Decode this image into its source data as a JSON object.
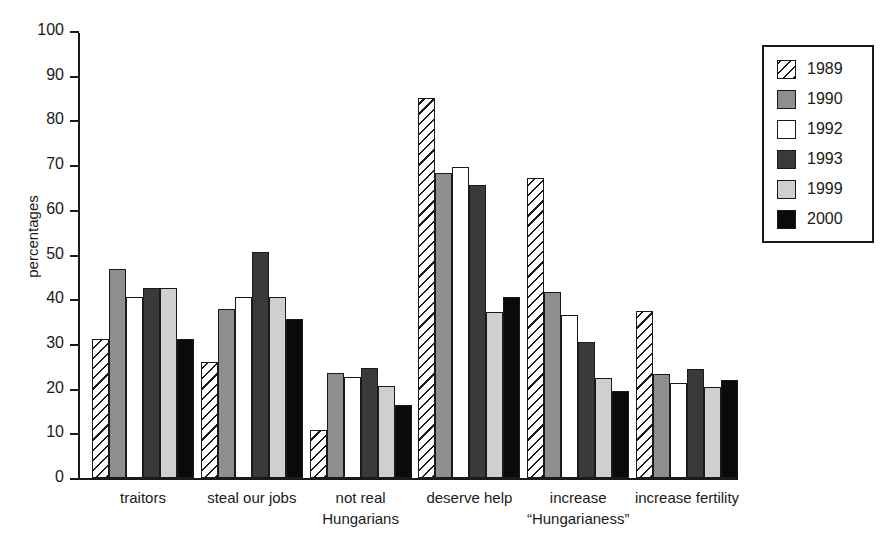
{
  "chart_data": {
    "type": "bar",
    "title": "",
    "xlabel": "",
    "ylabel": "percentages",
    "ylim": [
      0,
      100
    ],
    "ytick_step": 10,
    "yticks": [
      0,
      10,
      20,
      30,
      40,
      50,
      60,
      70,
      80,
      90,
      100
    ],
    "grid": false,
    "legend_position": "top-right",
    "categories": [
      "traitors",
      "steal our jobs",
      "not real Hungarians",
      "deserve help",
      "increase “Hungarianess”",
      "increase fertility"
    ],
    "series": [
      {
        "name": "1989",
        "fill": "hatch",
        "color": "#ffffff",
        "values": [
          31.0,
          26.0,
          10.7,
          85.0,
          67.2,
          37.3
        ]
      },
      {
        "name": "1990",
        "fill": "midgray",
        "color": "#8e8e8e",
        "values": [
          46.8,
          37.7,
          23.5,
          68.2,
          41.6,
          23.2
        ]
      },
      {
        "name": "1992",
        "fill": "white",
        "color": "#ffffff",
        "values": [
          40.6,
          40.5,
          22.5,
          69.5,
          36.4,
          21.2
        ]
      },
      {
        "name": "1993",
        "fill": "darkgray",
        "color": "#3a3a3a",
        "values": [
          42.6,
          50.5,
          24.6,
          65.6,
          30.4,
          24.3
        ]
      },
      {
        "name": "1999",
        "fill": "litegray",
        "color": "#cfcfcf",
        "values": [
          42.6,
          40.5,
          20.6,
          37.1,
          22.3,
          20.3
        ]
      },
      {
        "name": "2000",
        "fill": "black",
        "color": "#0a0a0a",
        "values": [
          31.2,
          35.6,
          16.4,
          40.6,
          19.5,
          22.0
        ]
      }
    ]
  },
  "axis": {
    "y_title": "percentages"
  },
  "category_labels": [
    {
      "line1": "traitors",
      "line2": ""
    },
    {
      "line1": "steal our jobs",
      "line2": ""
    },
    {
      "line1": "not real",
      "line2": "Hungarians"
    },
    {
      "line1": "deserve help",
      "line2": ""
    },
    {
      "line1": "increase",
      "line2": "“Hungarianess”"
    },
    {
      "line1": "increase fertility",
      "line2": ""
    }
  ],
  "legend": {
    "entries": [
      {
        "label": "1989",
        "fill": "hatch"
      },
      {
        "label": "1990",
        "fill": "midgray"
      },
      {
        "label": "1992",
        "fill": "white"
      },
      {
        "label": "1993",
        "fill": "darkgray"
      },
      {
        "label": "1999",
        "fill": "litegray"
      },
      {
        "label": "2000",
        "fill": "black"
      }
    ]
  }
}
